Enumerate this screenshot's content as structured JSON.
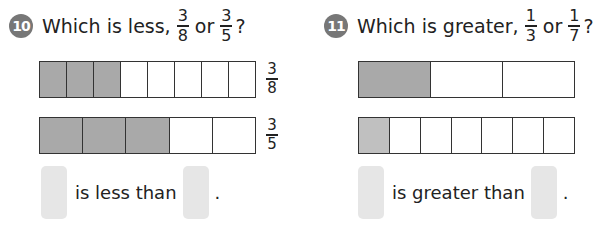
{
  "problems": [
    {
      "number": "10",
      "question_prefix": "Which is less,",
      "fraction_a": {
        "num": "3",
        "den": "8"
      },
      "connector": "or",
      "fraction_b": {
        "num": "3",
        "den": "5"
      },
      "question_suffix": "?",
      "bars": [
        {
          "parts": 8,
          "shaded": 3,
          "label": {
            "num": "3",
            "den": "8"
          }
        },
        {
          "parts": 5,
          "shaded": 3,
          "label": {
            "num": "3",
            "den": "5"
          }
        }
      ],
      "answer_text": "is less than",
      "answer_end": "."
    },
    {
      "number": "11",
      "question_prefix": "Which is greater,",
      "fraction_a": {
        "num": "1",
        "den": "3"
      },
      "connector": "or",
      "fraction_b": {
        "num": "1",
        "den": "7"
      },
      "question_suffix": "?",
      "bars": [
        {
          "parts": 3,
          "shaded": 1
        },
        {
          "parts": 7,
          "shaded": 1
        }
      ],
      "answer_text": "is greater than",
      "answer_end": "."
    }
  ],
  "colors": {
    "shade": "#a9a9a9",
    "badge": "#777777",
    "answer_box": "#e6e6e6"
  }
}
